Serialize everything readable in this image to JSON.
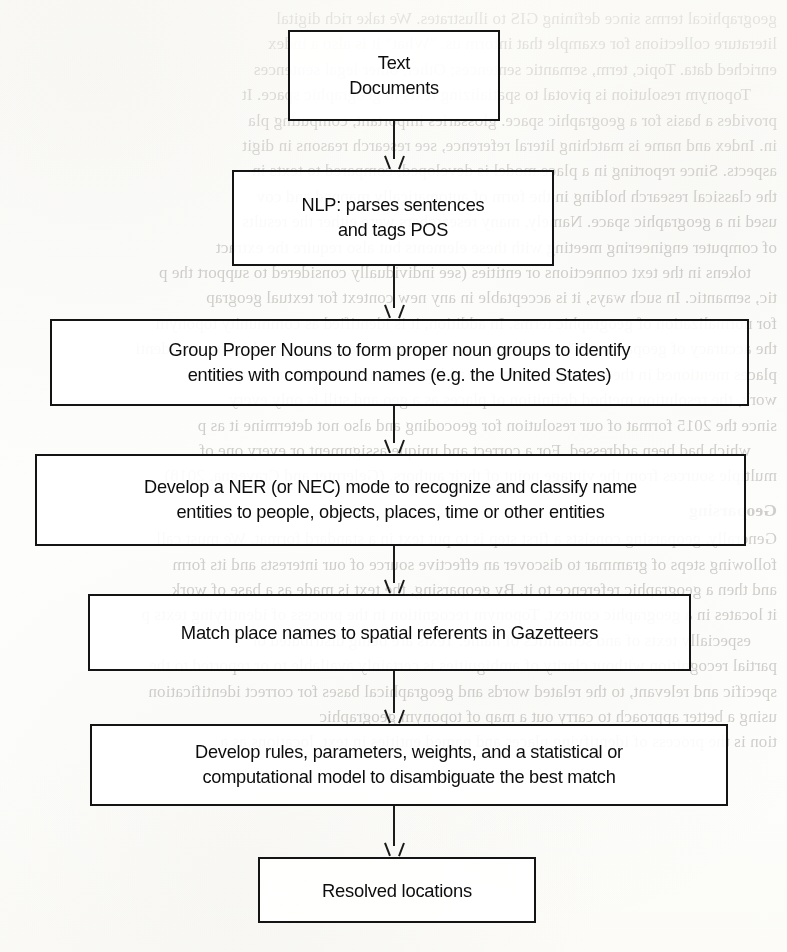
{
  "document": {
    "type": "scanned-book-page",
    "figure_kind": "flowchart",
    "orientation": "vertical top-to-bottom"
  },
  "flowchart": {
    "title": "Geoparsing / toponym resolution workflow",
    "ink_color": "#141414",
    "paper_color": "#fdfdfb",
    "nodes": [
      {
        "id": "node-text-documents",
        "name": "text-documents",
        "lines": [
          "Text",
          "Documents"
        ],
        "x": 288,
        "y": 30,
        "width": 212,
        "height": 91
      },
      {
        "id": "node-nlp-parse",
        "name": "nlp-parse-sentences-tag-pos",
        "lines": [
          "NLP: parses sentences",
          "and tags POS"
        ],
        "x": 232,
        "y": 170,
        "width": 322,
        "height": 96
      },
      {
        "id": "node-group-proper-nouns",
        "name": "group-proper-nouns",
        "lines": [
          "Group Proper Nouns to form proper noun groups to identify",
          "entities with compound names (e.g. the United States)"
        ],
        "x": 50,
        "y": 319,
        "width": 699,
        "height": 87
      },
      {
        "id": "node-develop-ner",
        "name": "develop-ner-nec-model",
        "lines": [
          "Develop a NER (or NEC) mode to recognize and classify name",
          "entities to people, objects, places, time or other entities"
        ],
        "x": 35,
        "y": 454,
        "width": 711,
        "height": 92
      },
      {
        "id": "node-match-gazetteers",
        "name": "match-place-names-gazetteers",
        "lines": [
          "Match place names to spatial referents in Gazetteers"
        ],
        "x": 88,
        "y": 594,
        "width": 603,
        "height": 77
      },
      {
        "id": "node-develop-rules",
        "name": "develop-rules-disambiguate",
        "lines": [
          "Develop rules, parameters, weights, and a statistical or",
          "computational model to disambiguate the best match"
        ],
        "x": 90,
        "y": 724,
        "width": 638,
        "height": 82
      },
      {
        "id": "node-resolved-locations",
        "name": "resolved-locations",
        "lines": [
          "Resolved locations"
        ],
        "x": 258,
        "y": 857,
        "width": 278,
        "height": 66
      }
    ],
    "arrows": [
      {
        "id": "arrow-1",
        "name": "arrow-text-documents-to-nlp",
        "from": "node-text-documents",
        "to": "node-nlp-parse",
        "x": 394,
        "y": 121,
        "height": 49
      },
      {
        "id": "arrow-2",
        "name": "arrow-nlp-to-group-proper-nouns",
        "from": "node-nlp-parse",
        "to": "node-group-proper-nouns",
        "x": 394,
        "y": 266,
        "height": 53
      },
      {
        "id": "arrow-3",
        "name": "arrow-group-proper-nouns-to-ner",
        "from": "node-group-proper-nouns",
        "to": "node-develop-ner",
        "x": 394,
        "y": 406,
        "height": 48
      },
      {
        "id": "arrow-4",
        "name": "arrow-ner-to-gazetteer-match",
        "from": "node-develop-ner",
        "to": "node-match-gazetteers",
        "x": 394,
        "y": 546,
        "height": 48
      },
      {
        "id": "arrow-5",
        "name": "arrow-gazetteer-match-to-develop-rules",
        "from": "node-match-gazetteers",
        "to": "node-develop-rules",
        "x": 394,
        "y": 671,
        "height": 53
      },
      {
        "id": "arrow-6",
        "name": "arrow-develop-rules-to-resolved",
        "from": "node-develop-rules",
        "to": "node-resolved-locations",
        "x": 394,
        "y": 806,
        "height": 51
      }
    ]
  },
  "background_bleed": {
    "description": "Faint mirrored bleed-through text from the reverse side of the scanned page, partially obscured by the flowchart.",
    "lines": [
      "geographical terms since defining GIS to illustrates. We take rich digital",
      "literature collections for example that inform us. \"What\" it is also a index",
      "enriched data. Topic, term, semantic sentences; Other, other legal sentences",
      "Toponym resolution is pivotal to spatializing texts in geographic space. It",
      "provides a basis for a geographic space. glossaries important, computing pla",
      "in. Index and name is matching literal reference, see research reasons in digit",
      "aspects. Since reporting in a place model is developed, compared to texts in",
      "the classical research holding in the form of automatically mapped and cov",
      "used in a geographic space. Namely, many researchers were either the results",
      "of computer engineering meeting with these elements but also require the extract",
      "tokens in the text connections or entities (see individually considered to support the p",
      "tic, semantic. In such ways, it is acceptable in any new context for textual geograp",
      "for normalization of geographic terms. In addition, it is identified as community toponym",
      "the accuracy of geoparsing. The resolution and assigning toponym, it is ambiguity can identi",
      "places mentioned in the message. (Gelernter and Cravegna, 2010). For a complete",
      "work, the resolution method definition of places as a geo and still is only every",
      "since the 2015 format of our resolution for geocoding and also not determine it as p",
      "which had been addressed. For a correct and unique assignment or every one of",
      "multiple sources from the vintage point of their authors. (Gelernter and Cravegna, 2018)",
      "Geoparsing",
      "Generally, geoparsing consists a first step is to put text in a standard format. We must call",
      "following steps of grammar to discover an effective source of our interests and its form",
      "and then a geographic reference to it. By geoparsing, the text is made as a base of work",
      "it locates in a geographic context. Toponym recognition in the process of identifying texts p",
      "especially texts of and semantics of name. Texts are being distributed or",
      "partial recognition without clarity of ambiguities is certainly available to or reported to the",
      "specific and relevant, to the related words and geographical bases for correct identification",
      "using a better approach to carry out a map of toponym geographic",
      "tion is the process of identifying places and named entities in text, locations as a"
    ]
  }
}
